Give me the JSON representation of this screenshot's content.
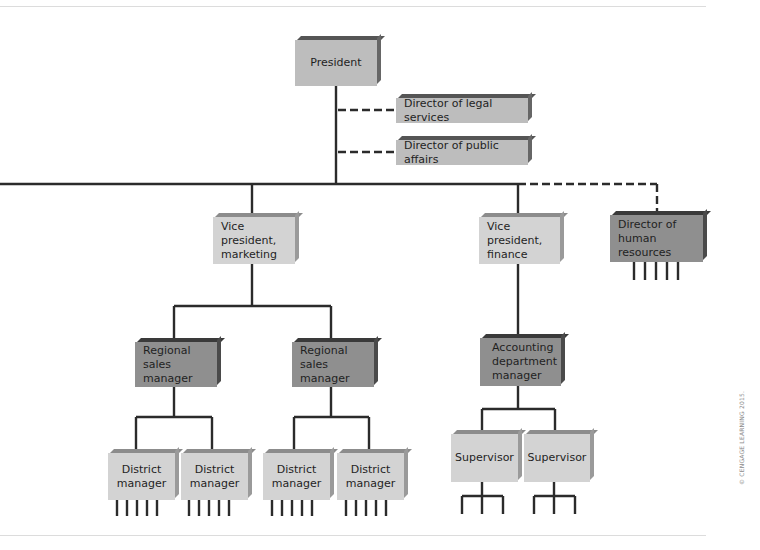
{
  "diagram": {
    "type": "organization-chart",
    "nodes": {
      "president": "President",
      "legal": "Director of legal services",
      "public_affairs": "Director of public affairs",
      "vp_marketing": "Vice president,\nmarketing",
      "vp_finance": "Vice president,\nfinance",
      "hr": "Director of\nhuman resources",
      "rsm1": "Regional\nsales manager",
      "rsm2": "Regional\nsales manager",
      "accounting": "Accounting\ndepartment\nmanager",
      "dm1": "District\nmanager",
      "dm2": "District\nmanager",
      "dm3": "District\nmanager",
      "dm4": "District\nmanager",
      "sup1": "Supervisor",
      "sup2": "Supervisor"
    },
    "relationships": [
      {
        "from": "President",
        "to": "Director of legal services",
        "style": "staff (dashed)"
      },
      {
        "from": "President",
        "to": "Director of public affairs",
        "style": "staff (dashed)"
      },
      {
        "from": "President",
        "to": "Vice president, marketing",
        "style": "line (solid)"
      },
      {
        "from": "President",
        "to": "Vice president, finance",
        "style": "line (solid)"
      },
      {
        "from": "President",
        "to": "Director of human resources",
        "style": "staff (dashed)"
      },
      {
        "from": "Vice president, marketing",
        "to": "Regional sales manager",
        "style": "line (solid)",
        "count": 2
      },
      {
        "from": "Regional sales manager",
        "to": "District manager",
        "style": "line (solid)",
        "count": 2
      },
      {
        "from": "Vice president, finance",
        "to": "Accounting department manager",
        "style": "line (solid)"
      },
      {
        "from": "Accounting department manager",
        "to": "Supervisor",
        "style": "line (solid)",
        "count": 2
      }
    ],
    "colors": {
      "line": "#2b2b2b",
      "box_light": "#d3d3d3",
      "box_mid": "#bdbdbd",
      "box_dark": "#8f8f8f"
    }
  },
  "credit": "© CENGAGE LEARNING 2015."
}
